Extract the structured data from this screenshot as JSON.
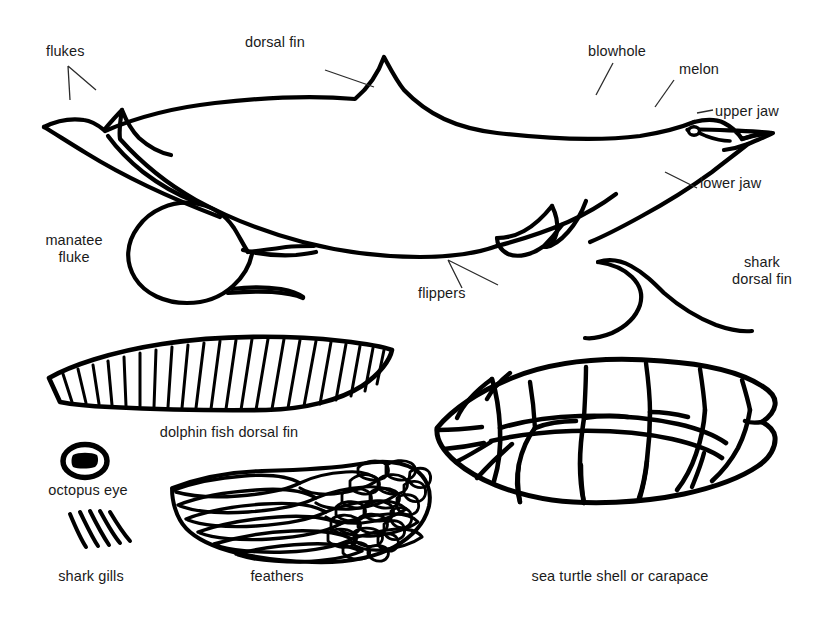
{
  "document": {
    "title": "Marine Animal Anatomy Line Drawing",
    "type": "line-art diagram",
    "background_color": "#ffffff",
    "ink_color": "#000000",
    "text_color": "#1a1a1a"
  },
  "labels": {
    "flukes": "flukes",
    "dorsal_fin": "dorsal fin",
    "blowhole": "blowhole",
    "melon": "melon",
    "upper_jaw": "upper jaw",
    "lower_jaw": "lower jaw",
    "flippers": "flippers",
    "manatee_fluke_line1": "manatee",
    "manatee_fluke_line2": "fluke",
    "shark_dorsal_fin_line1": "shark",
    "shark_dorsal_fin_line2": "dorsal fin",
    "dolphin_fish_dorsal_fin": "dolphin fish dorsal fin",
    "octopus_eye": "octopus eye",
    "shark_gills": "shark gills",
    "feathers": "feathers",
    "sea_turtle_shell": "sea turtle shell or carapace"
  },
  "figures": [
    {
      "name": "bottlenose-dolphin",
      "label_count": 6
    },
    {
      "name": "manatee-fluke",
      "label_count": 1
    },
    {
      "name": "shark-dorsal-fin",
      "label_count": 1
    },
    {
      "name": "dolphin-fish-dorsal-fin",
      "label_count": 1,
      "ray_count": 24
    },
    {
      "name": "octopus-eye",
      "label_count": 1
    },
    {
      "name": "shark-gills",
      "label_count": 1,
      "gill_count": 5
    },
    {
      "name": "bird-wing-feathers",
      "label_count": 1
    },
    {
      "name": "sea-turtle-carapace",
      "label_count": 1
    }
  ]
}
